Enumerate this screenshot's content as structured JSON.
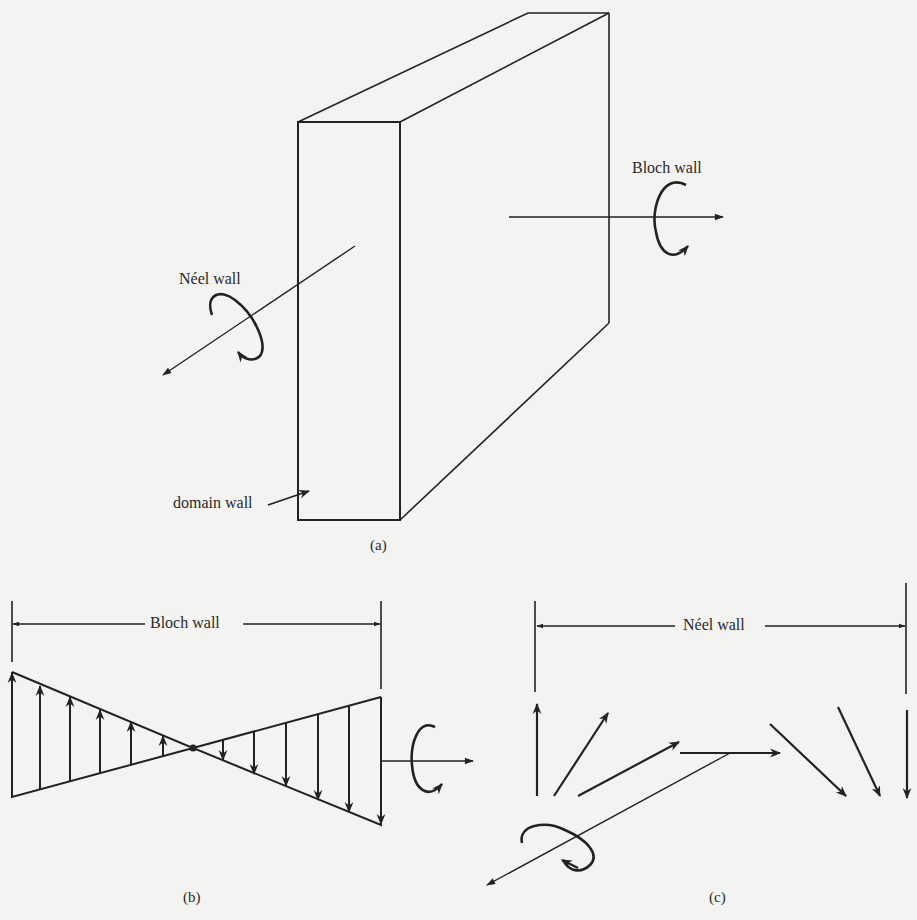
{
  "figure": {
    "panel_a": {
      "caption": "(a)",
      "labels": {
        "bloch": "Bloch wall",
        "neel": "Néel wall",
        "domain": "domain wall"
      }
    },
    "panel_b": {
      "caption": "(b)",
      "dimension_label": "Bloch wall",
      "up_arrow_count": 6,
      "down_arrow_count": 6
    },
    "panel_c": {
      "caption": "(c)",
      "dimension_label": "Néel wall",
      "arrow_count": 7
    },
    "colors": {
      "ink": "#222222",
      "paper": "#f3f3f1"
    }
  }
}
